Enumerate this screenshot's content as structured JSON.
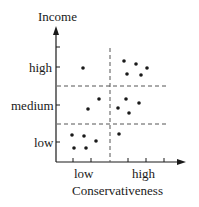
{
  "chart_data": {
    "type": "scatter",
    "title": "",
    "xlabel": "Conservativeness",
    "ylabel": "Income",
    "x_tick_labels": [
      "low",
      "high"
    ],
    "y_tick_labels": [
      "low",
      "medium",
      "high"
    ],
    "grid": false,
    "dividers": {
      "vertical_dashed": 1,
      "horizontal_dashed": 2
    },
    "points_px": [
      [
        83,
        68
      ],
      [
        124,
        61
      ],
      [
        136,
        64
      ],
      [
        147,
        68
      ],
      [
        127,
        74
      ],
      [
        141,
        75
      ],
      [
        99,
        99
      ],
      [
        88,
        109
      ],
      [
        118,
        108
      ],
      [
        126,
        99
      ],
      [
        139,
        103
      ],
      [
        129,
        113
      ],
      [
        72,
        135
      ],
      [
        84,
        136
      ],
      [
        96,
        141
      ],
      [
        74,
        148
      ],
      [
        86,
        148
      ],
      [
        119,
        134
      ]
    ],
    "clusters": [
      {
        "region": "low conservativeness / high income",
        "count": 1
      },
      {
        "region": "high conservativeness / high income",
        "count": 5
      },
      {
        "region": "low conservativeness / medium income",
        "count": 2
      },
      {
        "region": "high conservativeness / medium income",
        "count": 4
      },
      {
        "region": "low conservativeness / low income",
        "count": 5
      },
      {
        "region": "high conservativeness / low income",
        "count": 1
      }
    ]
  },
  "labels": {
    "y_title": "Income",
    "x_title": "Conservativeness",
    "y_high": "high",
    "y_medium": "medium",
    "y_low": "low",
    "x_low": "low",
    "x_high": "high"
  },
  "colors": {
    "ink": "#1a1a1a",
    "dash": "#555555"
  }
}
